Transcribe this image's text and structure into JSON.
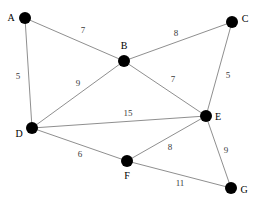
{
  "diagram": {
    "type": "node-link-graph",
    "width": 260,
    "height": 207,
    "background_color": "#ffffff",
    "node_color": "#000000",
    "edge_color": "#8f8f8f",
    "label_color": "#000000",
    "weight_color": "#3a3a3a",
    "node_radius": 6,
    "nodes": [
      {
        "id": "A",
        "label": "A",
        "x": 25,
        "y": 18,
        "label_x": 11,
        "label_y": 18
      },
      {
        "id": "B",
        "label": "B",
        "x": 124,
        "y": 61,
        "label_x": 124,
        "label_y": 46
      },
      {
        "id": "C",
        "label": "C",
        "x": 232,
        "y": 22,
        "label_x": 245,
        "label_y": 19
      },
      {
        "id": "D",
        "label": "D",
        "x": 32,
        "y": 128,
        "label_x": 19,
        "label_y": 134
      },
      {
        "id": "E",
        "label": "E",
        "x": 206,
        "y": 116,
        "label_x": 218,
        "label_y": 117
      },
      {
        "id": "F",
        "label": "F",
        "x": 127,
        "y": 161,
        "label_x": 127,
        "label_y": 176
      },
      {
        "id": "G",
        "label": "G",
        "x": 231,
        "y": 188,
        "label_x": 244,
        "label_y": 190
      }
    ],
    "edges": [
      {
        "id": "A-B",
        "source": "A",
        "target": "B",
        "weight": "7",
        "label_x": 83,
        "label_y": 30
      },
      {
        "id": "A-D",
        "source": "A",
        "target": "D",
        "weight": "5",
        "label_x": 18,
        "label_y": 76
      },
      {
        "id": "B-C",
        "source": "B",
        "target": "C",
        "weight": "8",
        "label_x": 176,
        "label_y": 33
      },
      {
        "id": "B-D",
        "source": "B",
        "target": "D",
        "weight": "9",
        "label_x": 78,
        "label_y": 83
      },
      {
        "id": "B-E",
        "source": "B",
        "target": "E",
        "weight": "7",
        "label_x": 173,
        "label_y": 79
      },
      {
        "id": "C-E",
        "source": "C",
        "target": "E",
        "weight": "5",
        "label_x": 228,
        "label_y": 75
      },
      {
        "id": "D-E",
        "source": "D",
        "target": "E",
        "weight": "15",
        "label_x": 128,
        "label_y": 113
      },
      {
        "id": "D-F",
        "source": "D",
        "target": "F",
        "weight": "6",
        "label_x": 80,
        "label_y": 154
      },
      {
        "id": "E-F",
        "source": "E",
        "target": "F",
        "weight": "8",
        "label_x": 170,
        "label_y": 147
      },
      {
        "id": "E-G",
        "source": "E",
        "target": "G",
        "weight": "9",
        "label_x": 226,
        "label_y": 150
      },
      {
        "id": "F-G",
        "source": "F",
        "target": "G",
        "weight": "11",
        "label_x": 180,
        "label_y": 183
      }
    ]
  }
}
